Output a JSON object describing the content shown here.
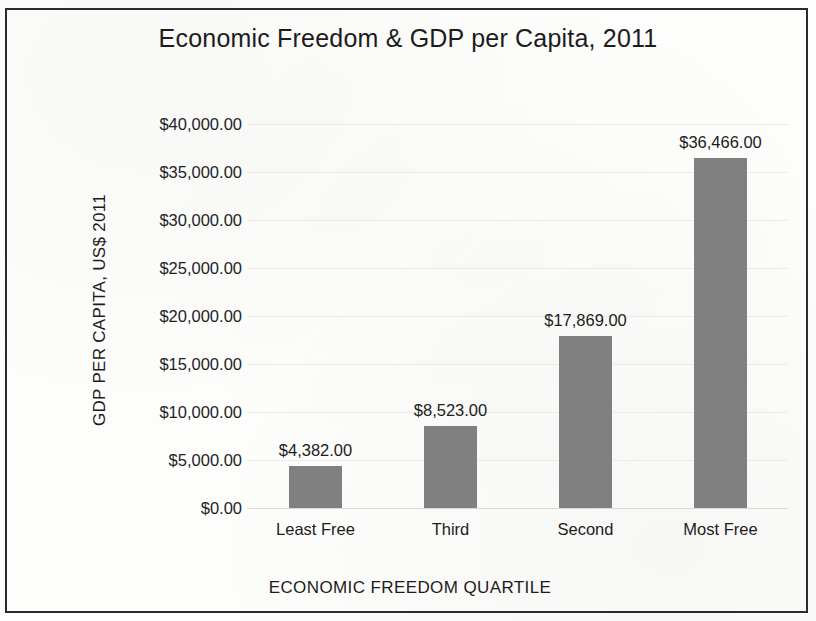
{
  "chart_data": {
    "type": "bar",
    "title": "Economic Freedom & GDP per Capita, 2011",
    "xlabel": "ECONOMIC FREEDOM QUARTILE",
    "ylabel": "GDP PER CAPITA, US$ 2011",
    "categories": [
      "Least Free",
      "Third",
      "Second",
      "Most Free"
    ],
    "values": [
      4382,
      8523,
      17869,
      36466
    ],
    "data_labels": [
      "$4,382.00",
      "$8,523.00",
      "$17,869.00",
      "$36,466.00"
    ],
    "ylim": [
      0,
      40000
    ],
    "ytick_values": [
      0,
      5000,
      10000,
      15000,
      20000,
      25000,
      30000,
      35000,
      40000
    ],
    "ytick_labels": [
      "$0.00",
      "$5,000.00",
      "$10,000.00",
      "$15,000.00",
      "$20,000.00",
      "$25,000.00",
      "$30,000.00",
      "$35,000.00",
      "$40,000.00"
    ],
    "grid": true,
    "legend": false,
    "bar_color": "#808080",
    "text_color": "#1c1c1c",
    "background_color": "#fdfdfc",
    "border_color": "#2b2b2b"
  }
}
